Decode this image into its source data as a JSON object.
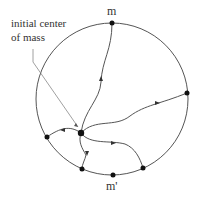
{
  "labels": {
    "annotation_line1": "initial center",
    "annotation_line2": "of mass",
    "top_point": "m",
    "bottom_point": "m'"
  },
  "colors": {
    "stroke": "#555555",
    "point": "#111111",
    "text": "#333333"
  }
}
